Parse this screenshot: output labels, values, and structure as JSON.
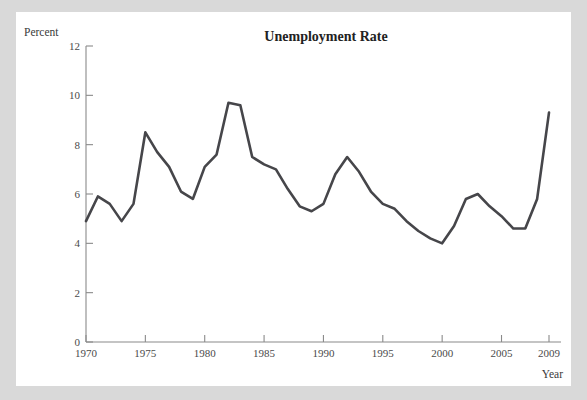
{
  "figure": {
    "background_color": "#d9d9d9",
    "panel_color": "#ffffff",
    "line_color": "#46464a",
    "axis_color": "#8a8a8a"
  },
  "chart_data": {
    "type": "line",
    "title": "Unemployment Rate",
    "xlabel": "Year",
    "ylabel": "Percent",
    "grid": false,
    "legend": "none",
    "xlim": [
      1970,
      2009
    ],
    "ylim": [
      0,
      12
    ],
    "xticks": [
      1970,
      1975,
      1980,
      1985,
      1990,
      1995,
      2000,
      2005,
      2009
    ],
    "xtick_labels": [
      "1970",
      "1975",
      "1980",
      "1985",
      "1990",
      "1995",
      "2000",
      "2005",
      "2009"
    ],
    "yticks": [
      0,
      2,
      4,
      6,
      8,
      10,
      12
    ],
    "ytick_labels": [
      "0",
      "2",
      "4",
      "6",
      "8",
      "10",
      "12"
    ],
    "x": [
      1970,
      1971,
      1972,
      1973,
      1974,
      1975,
      1976,
      1977,
      1978,
      1979,
      1980,
      1981,
      1982,
      1983,
      1984,
      1985,
      1986,
      1987,
      1988,
      1989,
      1990,
      1991,
      1992,
      1993,
      1994,
      1995,
      1996,
      1997,
      1998,
      1999,
      2000,
      2001,
      2002,
      2003,
      2004,
      2005,
      2006,
      2007,
      2008,
      2009
    ],
    "values": [
      4.9,
      5.9,
      5.6,
      4.9,
      5.6,
      8.5,
      7.7,
      7.1,
      6.1,
      5.8,
      7.1,
      7.6,
      9.7,
      9.6,
      7.5,
      7.2,
      7.0,
      6.2,
      5.5,
      5.3,
      5.6,
      6.8,
      7.5,
      6.9,
      6.1,
      5.6,
      5.4,
      4.9,
      4.5,
      4.2,
      4.0,
      4.7,
      5.8,
      6.0,
      5.5,
      5.1,
      4.6,
      4.6,
      5.8,
      9.3
    ],
    "series_name": "Unemployment Rate"
  }
}
